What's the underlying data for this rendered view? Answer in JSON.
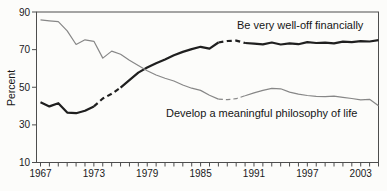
{
  "colors": {
    "background": "#fcfcfa",
    "axis": "#4d4d4d",
    "tick_text": "#1a1a1a",
    "thick_line": "#1f1f1f",
    "thin_line": "#878787"
  },
  "chart_data": {
    "type": "line",
    "title": "",
    "xlabel": "",
    "ylabel": "Percent",
    "ylim": [
      10,
      90
    ],
    "yticks": [
      10,
      30,
      50,
      70,
      90
    ],
    "x_labeled_ticks": [
      1967,
      1973,
      1979,
      1985,
      1991,
      1997,
      2003
    ],
    "x_minor_tick_step": 1,
    "grid": false,
    "frame": true,
    "legend_position": "inline-annotations",
    "x": [
      1967,
      1968,
      1969,
      1970,
      1971,
      1972,
      1973,
      1974,
      1975,
      1976,
      1977,
      1978,
      1979,
      1980,
      1981,
      1982,
      1983,
      1984,
      1985,
      1986,
      1987,
      1988,
      1989,
      1990,
      1991,
      1992,
      1993,
      1994,
      1995,
      1996,
      1997,
      1998,
      1999,
      2000,
      2001,
      2002,
      2003,
      2004,
      2005
    ],
    "series": [
      {
        "id": "financial",
        "name": "Be very well-off financially",
        "style": "thick",
        "color": "#1f1f1f",
        "dashed_ranges": [
          [
            1973,
            1976
          ],
          [
            1987,
            1990
          ]
        ],
        "values": [
          42,
          39.8,
          41.5,
          36.5,
          36.2,
          37.5,
          39.8,
          44,
          46.5,
          49.8,
          53.8,
          57.8,
          60.5,
          62.8,
          64.8,
          67,
          68.8,
          70.3,
          71.5,
          70.5,
          73.8,
          74.6,
          74.8,
          73.5,
          73.2,
          72.8,
          73.8,
          72.7,
          73.3,
          72.9,
          74,
          73.5,
          73.7,
          73.3,
          74.2,
          74,
          74.5,
          74.3,
          75
        ]
      },
      {
        "id": "philosophy",
        "name": "Develop a meaningful philosophy of life",
        "style": "thin",
        "color": "#878787",
        "dashed_ranges": [
          [
            1987,
            1990
          ]
        ],
        "values": [
          85.8,
          85.3,
          84.9,
          80,
          72.7,
          75.2,
          74.4,
          65.5,
          69.2,
          67.5,
          64.3,
          61.5,
          58.8,
          56.5,
          54.8,
          53.3,
          51.2,
          49.5,
          48.3,
          45.8,
          43.7,
          43.4,
          43.9,
          45.5,
          47,
          48.3,
          49.4,
          49.2,
          47.4,
          46.3,
          45.6,
          45.2,
          45,
          45.3,
          44.6,
          44,
          43.3,
          43.6,
          40.2
        ]
      }
    ]
  }
}
